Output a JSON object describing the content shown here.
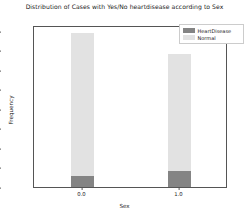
{
  "chart_data": {
    "type": "bar",
    "subtype": "stacked-bar",
    "title": "Distribution of Cases with Yes/No heartdisease according to Sex",
    "xlabel": "Sex",
    "ylabel": "Frequency",
    "categories": [
      "0.0",
      "1.0"
    ],
    "x": [
      0.0,
      1.0
    ],
    "xlim": [
      -0.5,
      1.5
    ],
    "ylim": [
      0,
      166000
    ],
    "yticks": [
      0,
      20000,
      40000,
      60000,
      80000,
      100000,
      120000,
      140000,
      160000
    ],
    "ytick_labels": [
      "0",
      "20000",
      "40000",
      "60000",
      "80000",
      "100000",
      "120000",
      "140000",
      "160000"
    ],
    "xticks": [
      0.0,
      1.0
    ],
    "xtick_labels": [
      "0.0",
      "1.0"
    ],
    "grid": false,
    "legend_position": "upper right",
    "series": [
      {
        "name": "HeartDisease",
        "color": "#848484",
        "values": [
          11000,
          16500
        ]
      },
      {
        "name": "Normal",
        "color": "#e2e2e2",
        "values": [
          147000,
          119500
        ]
      }
    ],
    "stack_totals": [
      158000,
      136000
    ],
    "bar_width_fraction": 0.23
  },
  "legend": {
    "entries": [
      {
        "label": "HeartDisease",
        "color": "#848484"
      },
      {
        "label": "Normal",
        "color": "#e2e2e2"
      }
    ]
  },
  "colors": {
    "background": "#ffffff",
    "axis": "#555555",
    "text": "#1a1a1a",
    "heart_disease": "#848484",
    "normal": "#e2e2e2"
  }
}
